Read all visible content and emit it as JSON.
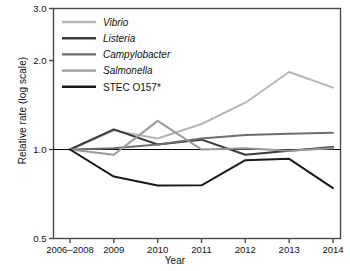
{
  "chart_data": {
    "type": "line",
    "title": "",
    "xlabel": "Year",
    "ylabel": "Relative rate (log scale)",
    "scale": "log",
    "grid": false,
    "reference_line": 1.0,
    "legend_position": "top-left",
    "ylim": [
      0.5,
      3.0
    ],
    "ytick_labels": [
      "3.0",
      "2.0",
      "1.0",
      "0.5"
    ],
    "ytick_values": [
      3.0,
      2.0,
      1.0,
      0.5
    ],
    "categories": [
      "2006–2008",
      "2009",
      "2010",
      "2011",
      "2012",
      "2013",
      "2014"
    ],
    "x": [
      "2006-2008",
      "2009",
      "2010",
      "2011",
      "2012",
      "2013",
      "2014"
    ],
    "series": [
      {
        "name": "Vibrio",
        "italic": true,
        "color": "#b6b6b6",
        "values": [
          1.0,
          1.16,
          1.09,
          1.22,
          1.44,
          1.83,
          1.62
        ]
      },
      {
        "name": "Listeria",
        "italic": true,
        "color": "#3a3a3a",
        "values": [
          1.0,
          1.17,
          1.04,
          1.08,
          0.96,
          0.99,
          1.02
        ]
      },
      {
        "name": "Campylobacter",
        "italic": true,
        "color": "#6e6e6e",
        "values": [
          1.0,
          1.01,
          1.04,
          1.09,
          1.12,
          1.13,
          1.14
        ]
      },
      {
        "name": "Salmonella",
        "italic": true,
        "color": "#9a9a9a",
        "values": [
          1.0,
          0.96,
          1.25,
          1.0,
          1.01,
          0.99,
          1.01
        ]
      },
      {
        "name": "STEC O157*",
        "italic": false,
        "color": "#1a1a1a",
        "values": [
          1.0,
          0.81,
          0.755,
          0.757,
          0.92,
          0.93,
          0.74
        ]
      }
    ]
  },
  "axes": {
    "frame_color": "#4a4a4a",
    "reference_line_color": "#000000"
  }
}
